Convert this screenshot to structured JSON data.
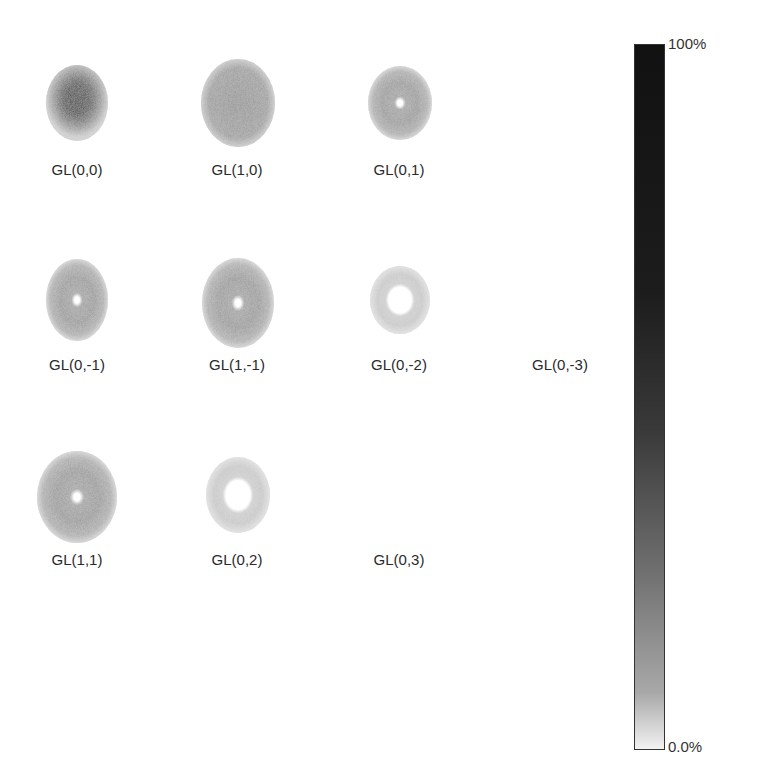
{
  "figure": {
    "type": "intensity-profile-grid",
    "modes": [
      {
        "label": "GL(0,0)",
        "shape": "gaussian",
        "peak_intensity": 1.0,
        "visible": true
      },
      {
        "label": "GL(1,0)",
        "shape": "flat-disc",
        "peak_intensity": 0.45,
        "visible": true
      },
      {
        "label": "GL(0,1)",
        "shape": "ring-small-hole",
        "peak_intensity": 0.38,
        "visible": true
      },
      {
        "label": "GL(0,-1)",
        "shape": "ring-small-hole",
        "peak_intensity": 0.38,
        "visible": true
      },
      {
        "label": "GL(1,-1)",
        "shape": "ring-small-hole",
        "peak_intensity": 0.4,
        "visible": true
      },
      {
        "label": "GL(0,-2)",
        "shape": "ring-large-hole",
        "peak_intensity": 0.22,
        "visible": true
      },
      {
        "label": "GL(0,-3)",
        "shape": "none",
        "peak_intensity": 0.0,
        "visible": false
      },
      {
        "label": "GL(1,1)",
        "shape": "ring-small-hole",
        "peak_intensity": 0.38,
        "visible": true
      },
      {
        "label": "GL(0,2)",
        "shape": "ring-large-hole",
        "peak_intensity": 0.22,
        "visible": true
      },
      {
        "label": "GL(0,3)",
        "shape": "none",
        "peak_intensity": 0.0,
        "visible": false
      }
    ]
  },
  "colorbar": {
    "max_label": "100%",
    "min_label": "0.0%",
    "colormap": "gray-reversed",
    "low_color": "#f2f2f2",
    "high_color": "#111111"
  }
}
